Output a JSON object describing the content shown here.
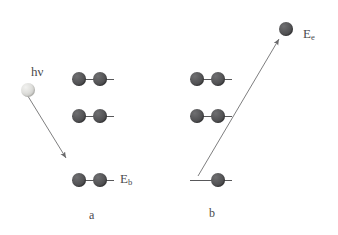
{
  "figure": {
    "background_color": "#ffffff",
    "electron_color": "#4a4a4c",
    "photon_color": "#dcdcd8",
    "line_color": "#58585a",
    "text_color": "#4b4b4d"
  },
  "panels": [
    {
      "id": "a",
      "caption": "a",
      "incident": {
        "label_main": "h",
        "label_symbol": "ν",
        "particle_name": "photon-sphere"
      },
      "levels": [
        {
          "name": "upper-level",
          "electrons": 2,
          "label": ""
        },
        {
          "name": "middle-level",
          "electrons": 2,
          "label": ""
        },
        {
          "name": "core-level",
          "electrons": 2,
          "label_main": "E",
          "label_sub": "b"
        }
      ],
      "arrow": {
        "name": "incident-photon-arrow",
        "direction": "down-right"
      }
    },
    {
      "id": "b",
      "caption": "b",
      "levels": [
        {
          "name": "upper-level",
          "electrons": 2,
          "label": ""
        },
        {
          "name": "middle-level",
          "electrons": 2,
          "label": ""
        },
        {
          "name": "core-level",
          "electrons": 1,
          "label": ""
        }
      ],
      "arrow": {
        "name": "ejected-electron-arrow",
        "direction": "up-right"
      },
      "ejected": {
        "particle_name": "ejected-electron",
        "label_main": "E",
        "label_sub": "e"
      }
    }
  ]
}
